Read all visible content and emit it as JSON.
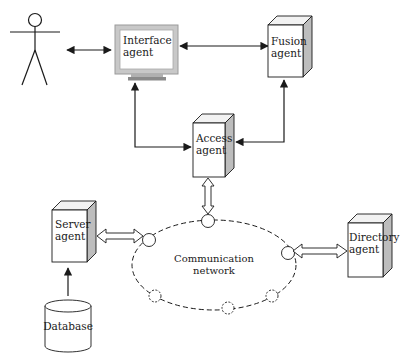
{
  "diagram": {
    "type": "multi-agent architecture",
    "actor": {
      "label": "",
      "icon": "stick-figure-user-icon"
    },
    "nodes": {
      "interface": {
        "line1": "Interface",
        "line2": "agent",
        "shape": "monitor"
      },
      "fusion": {
        "line1": "Fusion",
        "line2": "agent",
        "shape": "3d-box"
      },
      "access": {
        "line1": "Access",
        "line2": "agent",
        "shape": "3d-box"
      },
      "server": {
        "line1": "Server",
        "line2": "agent",
        "shape": "3d-box"
      },
      "directory": {
        "line1": "Directory",
        "line2": "agent",
        "shape": "3d-box"
      },
      "database": {
        "label": "Database",
        "shape": "cylinder"
      },
      "network": {
        "line1": "Communication",
        "line2": "network",
        "shape": "dashed-ellipse"
      }
    },
    "edges": [
      {
        "from": "user",
        "to": "interface",
        "style": "bidirectional-solid"
      },
      {
        "from": "fusion",
        "to": "interface",
        "style": "solid-arrow"
      },
      {
        "from": "access",
        "to": "interface",
        "style": "solid-arrow"
      },
      {
        "from": "access",
        "to": "fusion",
        "style": "bidirectional-solid"
      },
      {
        "from": "access",
        "to": "network",
        "style": "hollow-double-arrow"
      },
      {
        "from": "server",
        "to": "network",
        "style": "hollow-double-arrow"
      },
      {
        "from": "directory",
        "to": "network",
        "style": "hollow-double-arrow"
      },
      {
        "from": "database",
        "to": "server",
        "style": "solid-arrow"
      }
    ],
    "colors": {
      "line": "#1a1a1a",
      "box_face": "#ffffff",
      "box_side": "#bdbdbd",
      "box_top": "#f2f2f2",
      "monitor_frame": "#c8c8c8",
      "monitor_stand": "#9a9a9a"
    }
  }
}
